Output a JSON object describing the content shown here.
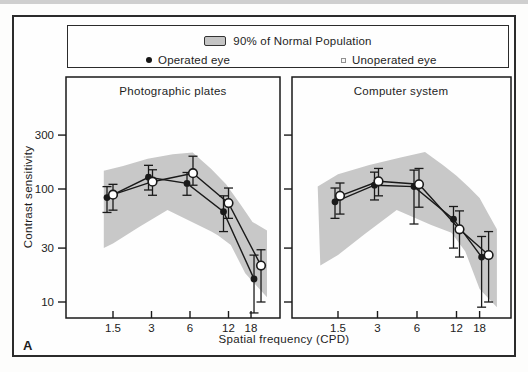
{
  "legend": {
    "band_label": "90% of Normal Population",
    "operated_label": "Operated eye",
    "unoperated_label": "Unoperated eye"
  },
  "figure_label": "A",
  "chart_data": {
    "type": "line",
    "x_label": "Spatial frequency (CPD)",
    "y_label": "Contrast sensitivity",
    "x_ticks": [
      "1.5",
      "3",
      "6",
      "12",
      "18"
    ],
    "x_tick_values": [
      1.5,
      3,
      6,
      12,
      18
    ],
    "y_ticks": [
      "300",
      "100",
      "30",
      "10"
    ],
    "y_tick_values": [
      300,
      100,
      30,
      10
    ],
    "y_scale": "log",
    "x_scale": "log",
    "ylim": [
      8,
      450
    ],
    "grid": false,
    "legend_position": "top",
    "band_meaning": "90% of Normal Population",
    "panels": [
      {
        "title": "Photographic plates",
        "band": [
          [
            1.27,
            145
          ],
          [
            1.8,
            160
          ],
          [
            2.8,
            185
          ],
          [
            4.4,
            203
          ],
          [
            6.3,
            210
          ],
          [
            8.8,
            150
          ],
          [
            11.5,
            110
          ],
          [
            15,
            72
          ],
          [
            18.5,
            51
          ],
          [
            24,
            43
          ],
          [
            24,
            11
          ],
          [
            16.2,
            18
          ],
          [
            12.5,
            32
          ],
          [
            9.9,
            39
          ],
          [
            8.8,
            42
          ],
          [
            4.0,
            65
          ],
          [
            2.4,
            46
          ],
          [
            1.5,
            33
          ],
          [
            1.27,
            30
          ]
        ],
        "series": [
          {
            "name": "Operated eye",
            "marker": "filled-circle",
            "x": [
              1.5,
              3,
              6,
              12,
              18
            ],
            "values": [
              84,
              127,
              112,
              63,
              16
            ],
            "err_lo": [
              62,
              98,
              88,
              42,
              8
            ],
            "err_hi": [
              105,
              162,
              140,
              87,
              26
            ],
            "dx": [
              -6,
              -3,
              -3,
              -5,
              3
            ]
          },
          {
            "name": "Unoperated eye",
            "marker": "open-circle",
            "x": [
              1.5,
              3,
              6,
              12,
              18
            ],
            "values": [
              89,
              116,
              138,
              75,
              21
            ],
            "err_lo": [
              65,
              88,
              108,
              55,
              10
            ],
            "err_hi": [
              110,
              148,
              195,
              102,
              29
            ],
            "dx": [
              0,
              1,
              3,
              0,
              10
            ]
          }
        ]
      },
      {
        "title": "Computer system",
        "band": [
          [
            1.05,
            105
          ],
          [
            1.5,
            135
          ],
          [
            2.6,
            163
          ],
          [
            4.5,
            190
          ],
          [
            6.9,
            212
          ],
          [
            9.5,
            162
          ],
          [
            12,
            131
          ],
          [
            15,
            103
          ],
          [
            18,
            83
          ],
          [
            21,
            60
          ],
          [
            24.4,
            44
          ],
          [
            24.4,
            9
          ],
          [
            18,
            13
          ],
          [
            14,
            28
          ],
          [
            11,
            41
          ],
          [
            7.7,
            48
          ],
          [
            4.2,
            65
          ],
          [
            2.4,
            40
          ],
          [
            1.5,
            26
          ],
          [
            1.1,
            21
          ]
        ],
        "series": [
          {
            "name": "Operated eye",
            "marker": "filled-circle",
            "x": [
              1.5,
              3,
              6,
              12,
              18
            ],
            "values": [
              77,
              108,
              105,
              54,
              25
            ],
            "err_lo": [
              55,
              80,
              49,
              30,
              9
            ],
            "err_hi": [
              102,
              141,
              147,
              70,
              38
            ],
            "dx": [
              -3,
              -3,
              -3,
              -3,
              2
            ]
          },
          {
            "name": "Unoperated eye",
            "marker": "open-circle",
            "x": [
              1.5,
              3,
              6,
              12,
              18
            ],
            "values": [
              87,
              117,
              110,
              44,
              26
            ],
            "err_lo": [
              60,
              87,
              69,
              25,
              10
            ],
            "err_hi": [
              113,
              152,
              152,
              64,
              42
            ],
            "dx": [
              2,
              1,
              2,
              3,
              9
            ]
          }
        ]
      }
    ],
    "layout": {
      "panel_boxes": [
        [
          66,
          77,
          280,
          318
        ],
        [
          292,
          77,
          511,
          318
        ]
      ],
      "x0_px": [
        113,
        338
      ],
      "octave_px": [
        38.5,
        39.5
      ],
      "y100_px": 189,
      "decade_px": 113
    },
    "colors": {
      "band": "#c8c8c8",
      "line": "#1a1a1a",
      "open_fill": "#ffffff",
      "text": "#222222"
    }
  }
}
